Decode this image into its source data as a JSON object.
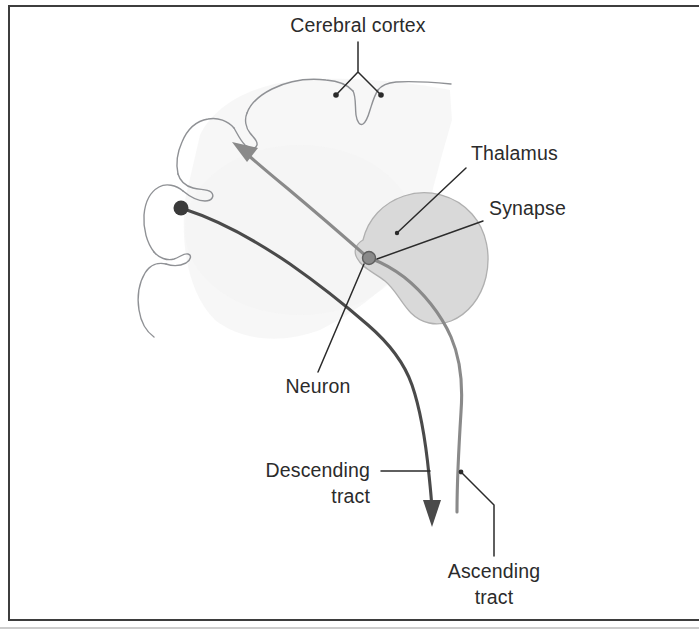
{
  "figure": {
    "title_visible": false,
    "background_color": "#ffffff",
    "frame_color": "#3d3d3d"
  },
  "labels": {
    "cerebral_cortex": "Cerebral cortex",
    "thalamus": "Thalamus",
    "synapse": "Synapse",
    "neuron": "Neuron",
    "descending_tract_line1": "Descending",
    "descending_tract_line2": "tract",
    "ascending_tract_line1": "Ascending",
    "ascending_tract_line2": "tract"
  },
  "anatomy": {
    "cortex_outline_color": "#8f9195",
    "cortex_fill_color": "#f3f3f3",
    "thalamus_fill_color": "#d9d9d9",
    "thalamus_stroke_color": "#b0b0b0",
    "descending_tract_color": "#4a4a4a",
    "ascending_tract_color": "#8a8a8a",
    "neuron_soma_color": "#3a3a3a",
    "synapse_color": "#8a8a8a"
  }
}
